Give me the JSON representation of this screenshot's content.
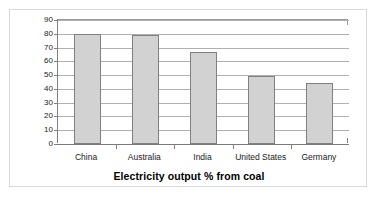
{
  "chart_data": {
    "type": "bar",
    "title": "Electricity output % from coal",
    "xlabel": "",
    "ylabel": "",
    "categories": [
      "China",
      "Australia",
      "India",
      "United States",
      "Germany"
    ],
    "values": [
      80,
      79,
      67,
      49,
      44.5
    ],
    "ylim": [
      0,
      90
    ],
    "ytick_values": [
      0,
      10,
      20,
      30,
      40,
      50,
      60,
      70,
      80,
      90
    ],
    "ytick_labels": [
      "0",
      "10",
      "20",
      "30",
      "40",
      "50",
      "60",
      "70",
      "80",
      "90"
    ],
    "grid": true,
    "legend": false,
    "series": [
      {
        "name": "Electricity output % from coal",
        "values": [
          80,
          79,
          67,
          49,
          44.5
        ]
      }
    ],
    "colors": {
      "bar_fill": "#d2d2d2",
      "bar_border": "#808080",
      "gridline": "#b0b0b0",
      "axis": "#808080",
      "text": "#1a1a1a",
      "figure_border": "#d9d9d9",
      "background": "#ffffff"
    }
  }
}
